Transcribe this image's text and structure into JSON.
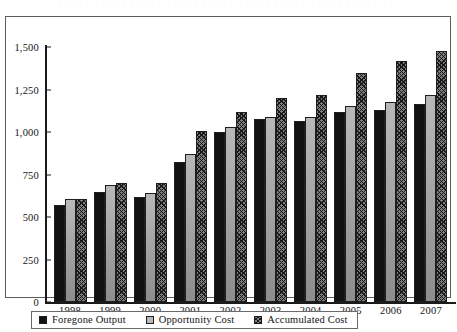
{
  "chart_data": {
    "type": "bar",
    "title": "",
    "subtitle": "",
    "xlabel": "",
    "ylabel": "",
    "categories": [
      "1998",
      "1999",
      "2000",
      "2001",
      "2002",
      "2003",
      "2004",
      "2005",
      "2006",
      "2007"
    ],
    "series": [
      {
        "name": "Foregone Output",
        "color": "#111111",
        "values": [
          570,
          645,
          615,
          825,
          1000,
          1075,
          1065,
          1120,
          1130,
          1165
        ]
      },
      {
        "name": "Opportunity Cost",
        "color": "#9d9d9d",
        "values": [
          605,
          690,
          640,
          870,
          1030,
          1090,
          1090,
          1155,
          1175,
          1215
        ]
      },
      {
        "name": "Accumulated Cost",
        "color": "#7e7e7e",
        "values": [
          605,
          700,
          700,
          1005,
          1120,
          1200,
          1215,
          1345,
          1420,
          1475
        ]
      }
    ],
    "ylim": [
      0,
      1500
    ],
    "yticks": [
      "0",
      "250",
      "500",
      "750",
      "1,000",
      "1,250",
      "1,500"
    ],
    "ytick_values": [
      0,
      250,
      500,
      750,
      1000,
      1250,
      1500
    ],
    "grid": false,
    "legend_position": "bottom"
  },
  "legend": {
    "items": [
      {
        "label": "Foregone Output",
        "swatch": "solid-black-swatch"
      },
      {
        "label": "Opportunity Cost",
        "swatch": "light-gray-swatch"
      },
      {
        "label": "Accumulated Cost",
        "swatch": "crosshatch-swatch"
      }
    ]
  }
}
